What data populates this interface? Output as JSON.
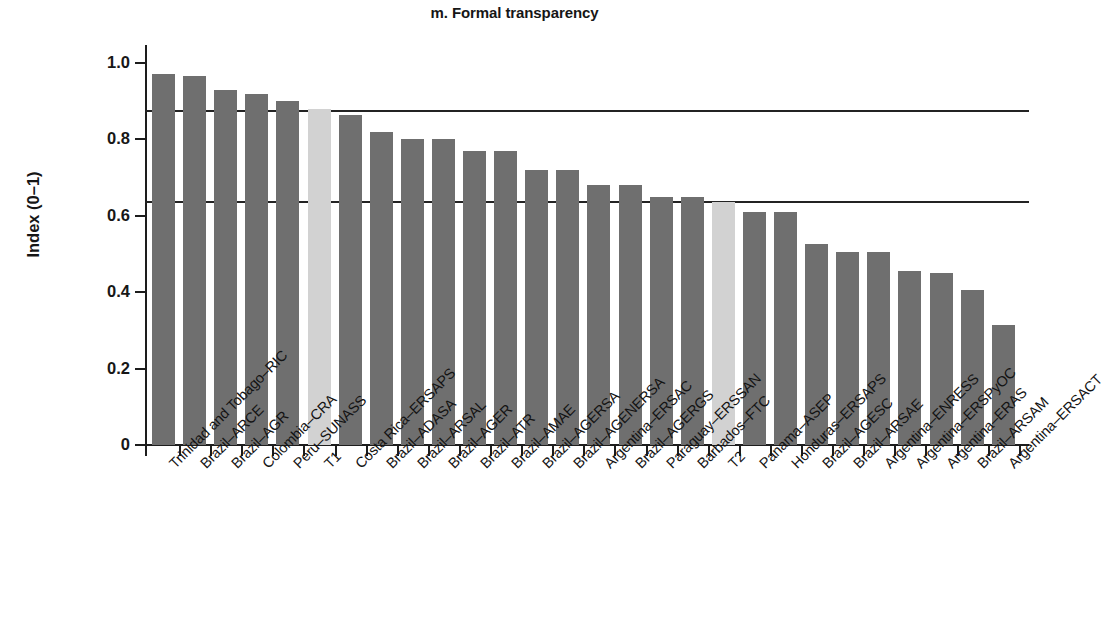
{
  "chart_data": {
    "type": "bar",
    "title": "m. Formal transparency",
    "xlabel": "",
    "ylabel": "Index (0–1)",
    "ylim": [
      0,
      1.0
    ],
    "y_ticks": [
      "0",
      "0.2",
      "0.4",
      "0.6",
      "0.8",
      "1.0"
    ],
    "y_tick_values": [
      0,
      0.2,
      0.4,
      0.6,
      0.8,
      1.0
    ],
    "grid": false,
    "legend": "none",
    "bar_color": "#6f6f6f",
    "highlight_color": "#d2d2d2",
    "reference_lines": [
      {
        "name": "upper-reference-line",
        "value": 0.876
      },
      {
        "name": "lower-reference-line",
        "value": 0.639
      }
    ],
    "categories": [
      "Trinidad and Tobago–RIC",
      "Brazil–ARCE",
      "Brazil–AGR",
      "Colombia–CRA",
      "Peru–SUNASS",
      "T1",
      "Costa Rica–ERSAPS",
      "Brazil–ADASA",
      "Brazil–ARSAL",
      "Brazil–AGER",
      "Brazil–ATR",
      "Brazil–AMAE",
      "Brazil–AGERSA",
      "Brazil–AGENERSA",
      "Argentina–ERSAC",
      "Brazil–AGERGS",
      "Paraguay–ERSSAN",
      "Barbados–FTC",
      "T2",
      "Panama–ASEP",
      "Honduras–ERSAPS",
      "Brazil–AGESC",
      "Brazil–ARSAE",
      "Argentina–ENRESS",
      "Argentina–ERSPyOC",
      "Argentina–ERAS",
      "Brazil–ARSAM",
      "Argentina–ERSACT"
    ],
    "values": [
      0.97,
      0.965,
      0.93,
      0.92,
      0.9,
      0.88,
      0.865,
      0.82,
      0.8,
      0.8,
      0.77,
      0.77,
      0.72,
      0.72,
      0.68,
      0.68,
      0.65,
      0.65,
      0.635,
      0.61,
      0.61,
      0.525,
      0.505,
      0.505,
      0.455,
      0.45,
      0.405,
      0.315
    ],
    "highlighted": [
      "T1",
      "T2"
    ]
  }
}
